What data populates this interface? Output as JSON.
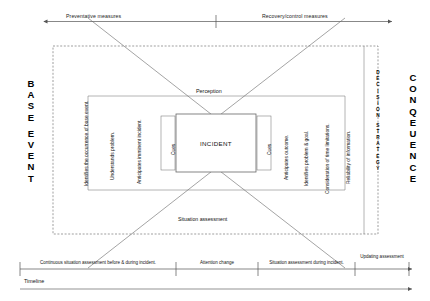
{
  "diagram": {
    "top_axis": {
      "left_label": "Preventative measures",
      "right_label": "Recovery/control measures"
    },
    "left_column": {
      "word_top": "BASE",
      "word_bottom": "EVENT"
    },
    "right_column": {
      "word": "CONQEUENCE"
    },
    "decision_strategy": {
      "word_top": "DECISION",
      "word_bottom": "STRATEGY"
    },
    "left_factors": [
      "Identifies the occurrence of base event.",
      "Understands problem.",
      "Anticipates imminent incident."
    ],
    "right_factors": [
      "Anticipates outcome.",
      "Identifies problem & goal.",
      "Consideration of time limitations.",
      "Reliability of information."
    ],
    "center": {
      "perception": "Perception",
      "incident": "INCIDENT",
      "cues_left": "Cues",
      "cues_right": "Cues",
      "situation_assessment": "Situation assessment"
    },
    "timeline": {
      "axis_label": "Timeline",
      "segments": [
        "Continuous situation assessment  before & during incident.",
        "Attention change",
        "Situation assessment during incident.",
        "Updating assessment"
      ]
    },
    "colors": {
      "line": "#555555",
      "dashed": "#777777",
      "text": "#111111"
    }
  }
}
